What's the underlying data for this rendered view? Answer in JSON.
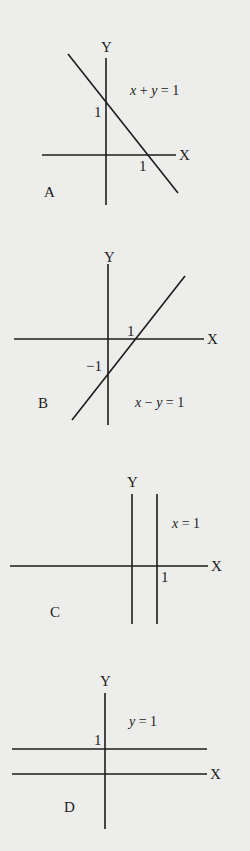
{
  "diagrams": [
    {
      "id": "A",
      "letter": "A",
      "equation": "x + y = 1",
      "equation_parts": {
        "lhs1": "x",
        "op": " + ",
        "lhs2": "y",
        "rhs": " = 1"
      },
      "x_axis_label": "X",
      "y_axis_label": "Y",
      "x_intercept_label": "1",
      "y_intercept_label": "1",
      "line": {
        "type": "line",
        "slope": -1,
        "intercept": 1
      }
    },
    {
      "id": "B",
      "letter": "B",
      "equation": "x − y = 1",
      "equation_parts": {
        "lhs1": "x",
        "op": " − ",
        "lhs2": "y",
        "rhs": " = 1"
      },
      "x_axis_label": "X",
      "y_axis_label": "Y",
      "x_intercept_label": "1",
      "y_intercept_label": "−1",
      "line": {
        "type": "line",
        "slope": 1,
        "intercept": -1
      }
    },
    {
      "id": "C",
      "letter": "C",
      "equation": "x = 1",
      "equation_parts": {
        "lhs1": "x",
        "rhs": " = 1"
      },
      "x_axis_label": "X",
      "y_axis_label": "Y",
      "x_intercept_label": "1",
      "line": {
        "type": "vertical",
        "x": 1
      }
    },
    {
      "id": "D",
      "letter": "D",
      "equation": "y = 1",
      "equation_parts": {
        "lhs1": "y",
        "rhs": " = 1"
      },
      "x_axis_label": "X",
      "y_axis_label": "Y",
      "y_intercept_label": "1",
      "line": {
        "type": "horizontal",
        "y": 1
      }
    }
  ]
}
